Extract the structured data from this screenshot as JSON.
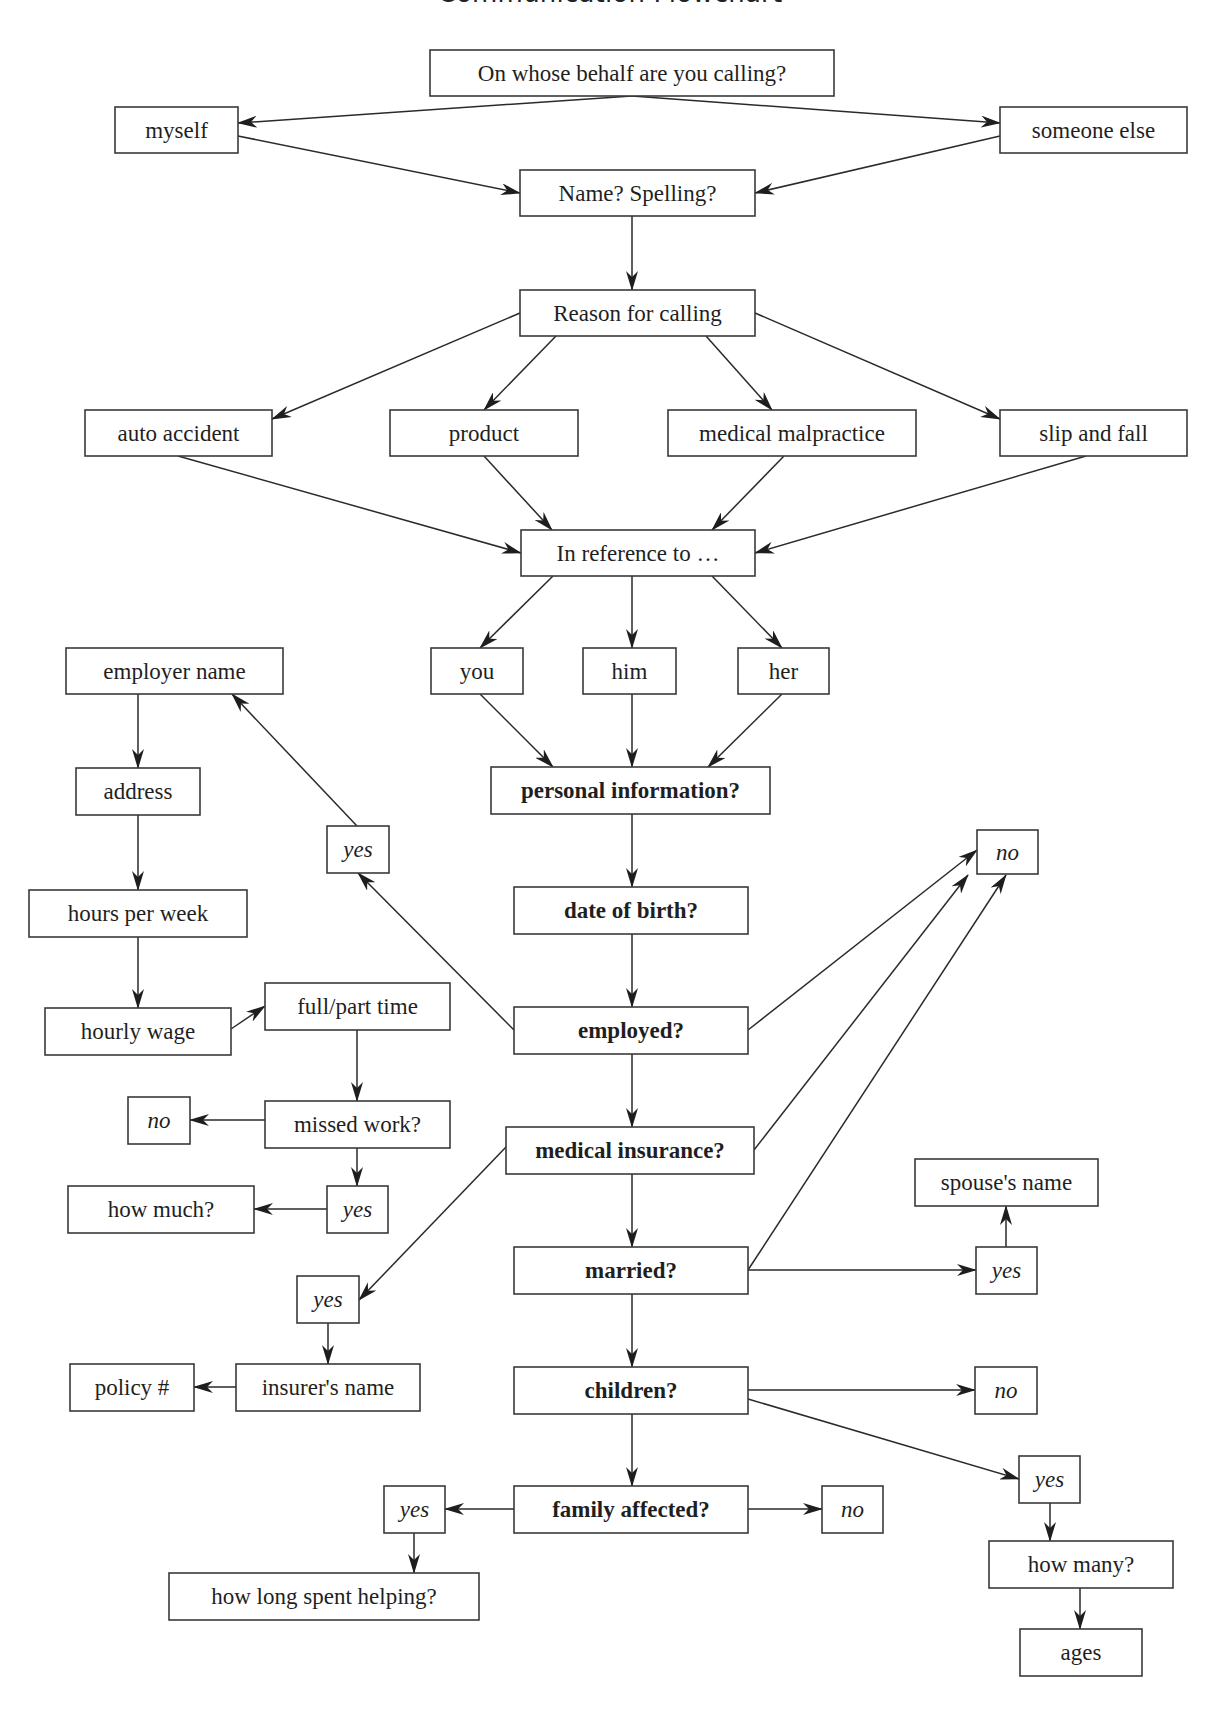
{
  "title": "Communication Flowchart",
  "colors": {
    "stroke": "#3a3a3a",
    "text": "#1f1f1f",
    "background": "#ffffff"
  },
  "nodes": [
    {
      "id": "behalf",
      "label": "On whose behalf are you calling?",
      "x": 430,
      "y": 50,
      "w": 404,
      "h": 46,
      "style": "normal"
    },
    {
      "id": "myself",
      "label": "myself",
      "x": 115,
      "y": 107,
      "w": 123,
      "h": 46,
      "style": "normal"
    },
    {
      "id": "someone",
      "label": "someone else",
      "x": 1000,
      "y": 107,
      "w": 187,
      "h": 46,
      "style": "normal"
    },
    {
      "id": "name",
      "label": "Name? Spelling?",
      "x": 520,
      "y": 170,
      "w": 235,
      "h": 46,
      "style": "normal"
    },
    {
      "id": "reason",
      "label": "Reason for calling",
      "x": 520,
      "y": 290,
      "w": 235,
      "h": 46,
      "style": "normal"
    },
    {
      "id": "auto",
      "label": "auto accident",
      "x": 85,
      "y": 410,
      "w": 187,
      "h": 46,
      "style": "normal"
    },
    {
      "id": "product",
      "label": "product",
      "x": 390,
      "y": 410,
      "w": 188,
      "h": 46,
      "style": "normal"
    },
    {
      "id": "malpractice",
      "label": "medical malpractice",
      "x": 668,
      "y": 410,
      "w": 248,
      "h": 46,
      "style": "normal"
    },
    {
      "id": "slip",
      "label": "slip and fall",
      "x": 1000,
      "y": 410,
      "w": 187,
      "h": 46,
      "style": "normal"
    },
    {
      "id": "reference",
      "label": "In reference to …",
      "x": 521,
      "y": 530,
      "w": 234,
      "h": 46,
      "style": "normal"
    },
    {
      "id": "you",
      "label": "you",
      "x": 431,
      "y": 648,
      "w": 92,
      "h": 46,
      "style": "normal"
    },
    {
      "id": "him",
      "label": "him",
      "x": 583,
      "y": 648,
      "w": 93,
      "h": 46,
      "style": "normal"
    },
    {
      "id": "her",
      "label": "her",
      "x": 738,
      "y": 648,
      "w": 91,
      "h": 46,
      "style": "normal"
    },
    {
      "id": "employer",
      "label": "employer name",
      "x": 66,
      "y": 648,
      "w": 217,
      "h": 46,
      "style": "normal"
    },
    {
      "id": "personal",
      "label": "personal information?",
      "x": 491,
      "y": 767,
      "w": 279,
      "h": 47,
      "style": "bold"
    },
    {
      "id": "address",
      "label": "address",
      "x": 76,
      "y": 768,
      "w": 124,
      "h": 47,
      "style": "normal"
    },
    {
      "id": "yes_emp",
      "label": "yes",
      "x": 327,
      "y": 826,
      "w": 62,
      "h": 47,
      "style": "italic"
    },
    {
      "id": "no_top",
      "label": "no",
      "x": 977,
      "y": 830,
      "w": 61,
      "h": 44,
      "style": "italic"
    },
    {
      "id": "dob",
      "label": "date of birth?",
      "x": 514,
      "y": 887,
      "w": 234,
      "h": 47,
      "style": "bold"
    },
    {
      "id": "hours",
      "label": "hours per week",
      "x": 29,
      "y": 890,
      "w": 218,
      "h": 47,
      "style": "normal"
    },
    {
      "id": "fullpart",
      "label": "full/part time",
      "x": 265,
      "y": 983,
      "w": 185,
      "h": 47,
      "style": "normal"
    },
    {
      "id": "wage",
      "label": "hourly wage",
      "x": 45,
      "y": 1008,
      "w": 186,
      "h": 47,
      "style": "normal"
    },
    {
      "id": "employed",
      "label": "employed?",
      "x": 514,
      "y": 1007,
      "w": 234,
      "h": 47,
      "style": "bold"
    },
    {
      "id": "no_missed",
      "label": "no",
      "x": 128,
      "y": 1097,
      "w": 62,
      "h": 47,
      "style": "italic"
    },
    {
      "id": "missed",
      "label": "missed work?",
      "x": 265,
      "y": 1101,
      "w": 185,
      "h": 47,
      "style": "normal"
    },
    {
      "id": "insurance",
      "label": "medical insurance?",
      "x": 506,
      "y": 1127,
      "w": 248,
      "h": 47,
      "style": "bold"
    },
    {
      "id": "spouse",
      "label": "spouse's name",
      "x": 915,
      "y": 1159,
      "w": 183,
      "h": 47,
      "style": "normal"
    },
    {
      "id": "howmuch",
      "label": "how much?",
      "x": 68,
      "y": 1186,
      "w": 186,
      "h": 47,
      "style": "normal"
    },
    {
      "id": "yes_missed",
      "label": "yes",
      "x": 327,
      "y": 1186,
      "w": 61,
      "h": 47,
      "style": "italic"
    },
    {
      "id": "married",
      "label": "married?",
      "x": 514,
      "y": 1247,
      "w": 234,
      "h": 47,
      "style": "bold"
    },
    {
      "id": "yes_married",
      "label": "yes",
      "x": 976,
      "y": 1247,
      "w": 61,
      "h": 47,
      "style": "italic"
    },
    {
      "id": "yes_ins",
      "label": "yes",
      "x": 297,
      "y": 1276,
      "w": 62,
      "h": 47,
      "style": "italic"
    },
    {
      "id": "policy",
      "label": "policy #",
      "x": 70,
      "y": 1364,
      "w": 124,
      "h": 47,
      "style": "normal"
    },
    {
      "id": "insurer",
      "label": "insurer's name",
      "x": 236,
      "y": 1364,
      "w": 184,
      "h": 47,
      "style": "normal"
    },
    {
      "id": "children",
      "label": "children?",
      "x": 514,
      "y": 1367,
      "w": 234,
      "h": 47,
      "style": "bold"
    },
    {
      "id": "no_children",
      "label": "no",
      "x": 975,
      "y": 1367,
      "w": 62,
      "h": 47,
      "style": "italic"
    },
    {
      "id": "yes_children",
      "label": "yes",
      "x": 1019,
      "y": 1456,
      "w": 61,
      "h": 47,
      "style": "italic"
    },
    {
      "id": "yes_family",
      "label": "yes",
      "x": 384,
      "y": 1486,
      "w": 61,
      "h": 47,
      "style": "italic"
    },
    {
      "id": "family",
      "label": "family affected?",
      "x": 514,
      "y": 1486,
      "w": 234,
      "h": 47,
      "style": "bold"
    },
    {
      "id": "no_family",
      "label": "no",
      "x": 822,
      "y": 1486,
      "w": 61,
      "h": 47,
      "style": "italic"
    },
    {
      "id": "howmany",
      "label": "how many?",
      "x": 989,
      "y": 1541,
      "w": 184,
      "h": 47,
      "style": "normal"
    },
    {
      "id": "helping",
      "label": "how long spent helping?",
      "x": 169,
      "y": 1573,
      "w": 310,
      "h": 47,
      "style": "normal"
    },
    {
      "id": "ages",
      "label": "ages",
      "x": 1020,
      "y": 1629,
      "w": 122,
      "h": 47,
      "style": "normal"
    }
  ],
  "edges": [
    {
      "from": "behalf",
      "to": "myself",
      "x1": 632,
      "y1": 96,
      "x2": 238,
      "y2": 123
    },
    {
      "from": "behalf",
      "to": "someone",
      "x1": 632,
      "y1": 96,
      "x2": 1000,
      "y2": 123
    },
    {
      "from": "myself",
      "to": "name",
      "x1": 238,
      "y1": 136,
      "x2": 520,
      "y2": 193
    },
    {
      "from": "someone",
      "to": "name",
      "x1": 1000,
      "y1": 136,
      "x2": 755,
      "y2": 193
    },
    {
      "from": "name",
      "to": "reason",
      "x1": 632,
      "y1": 216,
      "x2": 632,
      "y2": 290
    },
    {
      "from": "reason",
      "to": "auto",
      "x1": 520,
      "y1": 313,
      "x2": 272,
      "y2": 419
    },
    {
      "from": "reason",
      "to": "product",
      "x1": 556,
      "y1": 336,
      "x2": 484,
      "y2": 410
    },
    {
      "from": "reason",
      "to": "malpractice",
      "x1": 706,
      "y1": 336,
      "x2": 772,
      "y2": 410
    },
    {
      "from": "reason",
      "to": "slip",
      "x1": 755,
      "y1": 313,
      "x2": 1000,
      "y2": 419
    },
    {
      "from": "auto",
      "to": "reference",
      "x1": 178,
      "y1": 456,
      "x2": 521,
      "y2": 553
    },
    {
      "from": "product",
      "to": "reference",
      "x1": 484,
      "y1": 456,
      "x2": 552,
      "y2": 530
    },
    {
      "from": "malpractice",
      "to": "reference",
      "x1": 784,
      "y1": 456,
      "x2": 712,
      "y2": 530
    },
    {
      "from": "slip",
      "to": "reference",
      "x1": 1086,
      "y1": 456,
      "x2": 755,
      "y2": 553
    },
    {
      "from": "reference",
      "to": "you",
      "x1": 553,
      "y1": 576,
      "x2": 480,
      "y2": 648
    },
    {
      "from": "reference",
      "to": "him",
      "x1": 632,
      "y1": 576,
      "x2": 632,
      "y2": 648
    },
    {
      "from": "reference",
      "to": "her",
      "x1": 712,
      "y1": 576,
      "x2": 782,
      "y2": 648
    },
    {
      "from": "you",
      "to": "personal",
      "x1": 480,
      "y1": 694,
      "x2": 553,
      "y2": 767
    },
    {
      "from": "him",
      "to": "personal",
      "x1": 632,
      "y1": 694,
      "x2": 632,
      "y2": 767
    },
    {
      "from": "her",
      "to": "personal",
      "x1": 782,
      "y1": 694,
      "x2": 708,
      "y2": 767
    },
    {
      "from": "employer",
      "to": "address",
      "x1": 138,
      "y1": 694,
      "x2": 138,
      "y2": 768
    },
    {
      "from": "yes_emp",
      "to": "employer",
      "x1": 357,
      "y1": 826,
      "x2": 232,
      "y2": 694
    },
    {
      "from": "personal",
      "to": "dob",
      "x1": 632,
      "y1": 814,
      "x2": 632,
      "y2": 887
    },
    {
      "from": "address",
      "to": "hours",
      "x1": 138,
      "y1": 815,
      "x2": 138,
      "y2": 890
    },
    {
      "from": "employed",
      "to": "yes_emp",
      "x1": 514,
      "y1": 1030,
      "x2": 358,
      "y2": 873
    },
    {
      "from": "dob",
      "to": "employed",
      "x1": 632,
      "y1": 934,
      "x2": 632,
      "y2": 1007
    },
    {
      "from": "employed",
      "to": "no_top",
      "x1": 748,
      "y1": 1030,
      "x2": 977,
      "y2": 850
    },
    {
      "from": "insurance",
      "to": "no_top",
      "x1": 754,
      "y1": 1150,
      "x2": 968,
      "y2": 875
    },
    {
      "from": "married",
      "to": "no_top",
      "x1": 748,
      "y1": 1270,
      "x2": 1006,
      "y2": 875
    },
    {
      "from": "hours",
      "to": "wage",
      "x1": 138,
      "y1": 937,
      "x2": 138,
      "y2": 1008
    },
    {
      "from": "wage",
      "to": "fullpart",
      "x1": 231,
      "y1": 1029,
      "x2": 265,
      "y2": 1006
    },
    {
      "from": "fullpart",
      "to": "missed",
      "x1": 357,
      "y1": 1030,
      "x2": 357,
      "y2": 1101
    },
    {
      "from": "missed",
      "to": "no_missed",
      "x1": 265,
      "y1": 1120,
      "x2": 190,
      "y2": 1120
    },
    {
      "from": "missed",
      "to": "yes_missed",
      "x1": 357,
      "y1": 1148,
      "x2": 357,
      "y2": 1186
    },
    {
      "from": "yes_missed",
      "to": "howmuch",
      "x1": 327,
      "y1": 1209,
      "x2": 254,
      "y2": 1209
    },
    {
      "from": "employed",
      "to": "insurance",
      "x1": 632,
      "y1": 1054,
      "x2": 632,
      "y2": 1127
    },
    {
      "from": "insurance",
      "to": "yes_ins",
      "x1": 506,
      "y1": 1147,
      "x2": 359,
      "y2": 1300
    },
    {
      "from": "insurance",
      "to": "married",
      "x1": 632,
      "y1": 1174,
      "x2": 632,
      "y2": 1247
    },
    {
      "from": "married",
      "to": "yes_married",
      "x1": 748,
      "y1": 1270,
      "x2": 976,
      "y2": 1270
    },
    {
      "from": "yes_married",
      "to": "spouse",
      "x1": 1006,
      "y1": 1247,
      "x2": 1006,
      "y2": 1206
    },
    {
      "from": "yes_ins",
      "to": "insurer",
      "x1": 328,
      "y1": 1323,
      "x2": 328,
      "y2": 1364
    },
    {
      "from": "insurer",
      "to": "policy",
      "x1": 236,
      "y1": 1387,
      "x2": 194,
      "y2": 1387
    },
    {
      "from": "married",
      "to": "children",
      "x1": 632,
      "y1": 1294,
      "x2": 632,
      "y2": 1367
    },
    {
      "from": "children",
      "to": "no_children",
      "x1": 748,
      "y1": 1390,
      "x2": 975,
      "y2": 1390
    },
    {
      "from": "children",
      "to": "yes_children",
      "x1": 748,
      "y1": 1399,
      "x2": 1019,
      "y2": 1479
    },
    {
      "from": "children",
      "to": "family",
      "x1": 632,
      "y1": 1414,
      "x2": 632,
      "y2": 1486
    },
    {
      "from": "family",
      "to": "yes_family",
      "x1": 514,
      "y1": 1509,
      "x2": 445,
      "y2": 1509
    },
    {
      "from": "family",
      "to": "no_family",
      "x1": 748,
      "y1": 1509,
      "x2": 822,
      "y2": 1509
    },
    {
      "from": "yes_family",
      "to": "helping",
      "x1": 414,
      "y1": 1533,
      "x2": 414,
      "y2": 1573
    },
    {
      "from": "yes_children",
      "to": "howmany",
      "x1": 1050,
      "y1": 1503,
      "x2": 1050,
      "y2": 1541
    },
    {
      "from": "howmany",
      "to": "ages",
      "x1": 1080,
      "y1": 1588,
      "x2": 1080,
      "y2": 1629
    }
  ]
}
